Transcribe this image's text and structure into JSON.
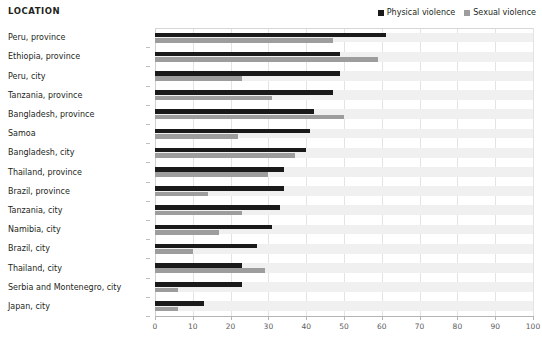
{
  "header": {
    "column_title": "LOCATION"
  },
  "legend": {
    "position": "top-right",
    "items": [
      {
        "label": "Physical violence",
        "color": "#1a1a1a",
        "icon": "square-swatch-icon"
      },
      {
        "label": "Sexual violence",
        "color": "#9d9d9d",
        "icon": "square-swatch-icon"
      }
    ]
  },
  "chart_data": {
    "type": "bar",
    "orientation": "horizontal",
    "title": "",
    "subtitle": "",
    "xlabel": "",
    "ylabel": "LOCATION",
    "xlim": [
      0,
      100
    ],
    "xticks": [
      0,
      10,
      20,
      30,
      40,
      50,
      60,
      70,
      80,
      90,
      100
    ],
    "xtick_labels": [
      "0",
      "10",
      "20",
      "30",
      "40",
      "50",
      "60",
      "70",
      "80",
      "90",
      "100"
    ],
    "grid": true,
    "legend_position": "top-right",
    "categories": [
      "Peru, province",
      "Ethiopia, province",
      "Peru, city",
      "Tanzania, province",
      "Bangladesh, province",
      "Samoa",
      "Bangladesh, city",
      "Thailand, province",
      "Brazil, province",
      "Tanzania, city",
      "Namibia, city",
      "Brazil, city",
      "Thailand, city",
      "Serbia and Montenegro, city",
      "Japan, city"
    ],
    "series": [
      {
        "name": "Physical violence",
        "color": "#1a1a1a",
        "values": [
          61,
          49,
          49,
          47,
          42,
          41,
          40,
          34,
          34,
          33,
          31,
          27,
          23,
          23,
          13
        ]
      },
      {
        "name": "Sexual violence",
        "color": "#9d9d9d",
        "values": [
          47,
          59,
          23,
          31,
          50,
          22,
          37,
          30,
          14,
          23,
          17,
          10,
          29,
          6,
          6
        ]
      }
    ]
  }
}
